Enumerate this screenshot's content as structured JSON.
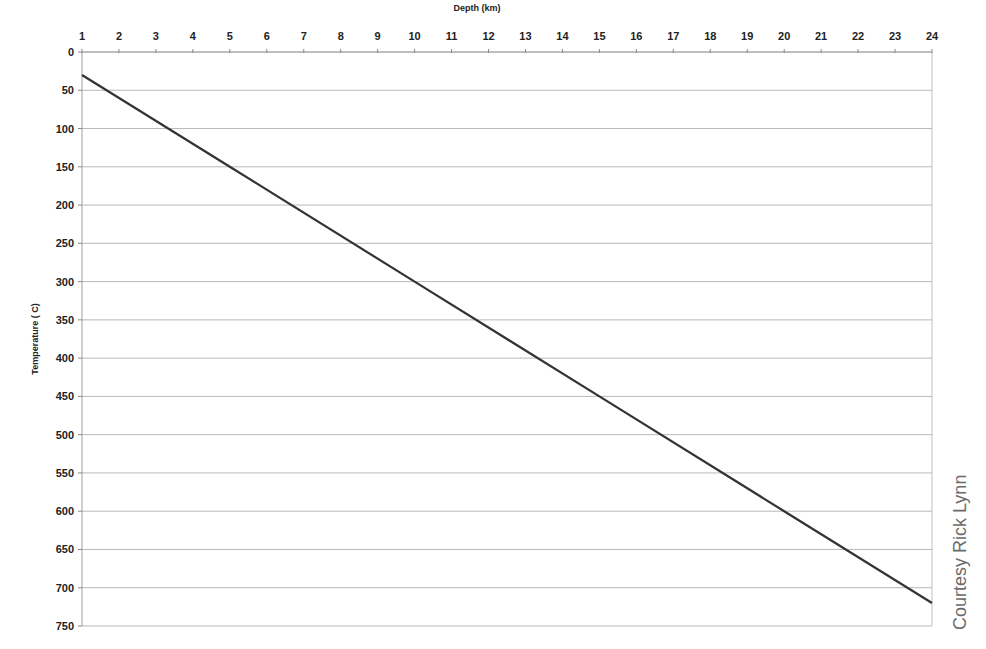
{
  "chart_data": {
    "type": "line",
    "title": "",
    "xlabel": "Depth (km)",
    "ylabel": "Temperature ( C)",
    "x_axis_position": "top",
    "y_axis_inverted": true,
    "xlim": [
      1,
      24
    ],
    "ylim": [
      0,
      750
    ],
    "x_ticks": [
      1,
      2,
      3,
      4,
      5,
      6,
      7,
      8,
      9,
      10,
      11,
      12,
      13,
      14,
      15,
      16,
      17,
      18,
      19,
      20,
      21,
      22,
      23,
      24
    ],
    "y_ticks": [
      0,
      50,
      100,
      150,
      200,
      250,
      300,
      350,
      400,
      450,
      500,
      550,
      600,
      650,
      700,
      750
    ],
    "grid": {
      "horizontal": true,
      "vertical": false
    },
    "legend": null,
    "series": [
      {
        "name": "Temperature",
        "color": "#333333",
        "x": [
          1,
          5,
          10,
          15,
          20,
          24
        ],
        "values": [
          30,
          150,
          300,
          450,
          600,
          720
        ]
      }
    ]
  },
  "credit": "Courtesy Rick Lynn"
}
